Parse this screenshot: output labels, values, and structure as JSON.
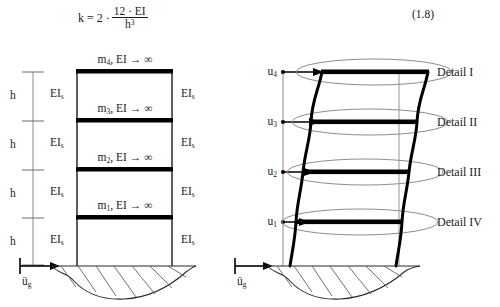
{
  "figure": {
    "equation": {
      "number": "(1.8)",
      "lhs": "k = 2 ·",
      "numerator": "12 · EI",
      "denominator_base": "h",
      "denominator_exponent": "3",
      "full_text": "k = 2 · 12·EI / h^3"
    },
    "left_model": {
      "title_hidden": "",
      "storey_height_label": "h",
      "storey_heights": [
        "h",
        "h",
        "h",
        "h"
      ],
      "ground_motion_label_base": "ü",
      "ground_motion_label_sub": "g",
      "floor_masses": [
        {
          "base": "m",
          "index": "4",
          "suffix": ", EI → ∞"
        },
        {
          "base": "m",
          "index": "3",
          "suffix": ", EI → ∞"
        },
        {
          "base": "m",
          "index": "2",
          "suffix": ", EI → ∞"
        },
        {
          "base": "m",
          "index": "1",
          "suffix": ", EI → ∞"
        }
      ],
      "column_stiffness_base": "EI",
      "column_stiffness_sub": "s",
      "column_stiffness_count_left": 4,
      "column_stiffness_count_right": 4
    },
    "right_model": {
      "displacements": [
        {
          "base": "u",
          "index": "4"
        },
        {
          "base": "u",
          "index": "3"
        },
        {
          "base": "u",
          "index": "2"
        },
        {
          "base": "u",
          "index": "1"
        }
      ],
      "details": [
        "Detail I",
        "Detail II",
        "Detail III",
        "Detail IV"
      ],
      "ground_motion_label_base": "ü",
      "ground_motion_label_sub": "g"
    },
    "colors": {
      "ink": "#1a1a1a",
      "slab": "#000000",
      "thin_line": "#7a7a7a",
      "ellipse": "#8c8c8c",
      "hatch": "#555555",
      "paper": "#ffffff"
    }
  }
}
